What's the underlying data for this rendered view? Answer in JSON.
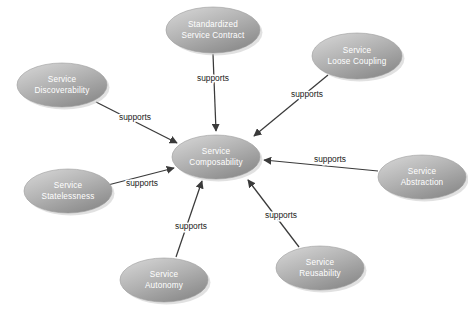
{
  "diagram": {
    "type": "radial-node-link",
    "background_color": "#ffffff",
    "node_fill_light": "#d8d8d8",
    "node_fill_dark": "#8c8c8c",
    "node_text_color": "#ffffff",
    "edge_color": "#3a3a3a",
    "edge_label_color": "#1c1c1c",
    "center": {
      "id": "service-composability",
      "label_line1": "Service",
      "label_line2": "Composability",
      "cx": 216,
      "cy": 157,
      "rx": 44,
      "ry": 22
    },
    "nodes": [
      {
        "id": "standardized-service-contract",
        "label_line1": "Standardized",
        "label_line2": "Service Contract",
        "cx": 213,
        "cy": 30,
        "rx": 47,
        "ry": 23
      },
      {
        "id": "service-loose-coupling",
        "label_line1": "Service",
        "label_line2": "Loose Coupling",
        "cx": 357,
        "cy": 56,
        "rx": 45,
        "ry": 23
      },
      {
        "id": "service-abstraction",
        "label_line1": "Service",
        "label_line2": "Abstraction",
        "cx": 422,
        "cy": 177,
        "rx": 44,
        "ry": 22
      },
      {
        "id": "service-reusability",
        "label_line1": "Service",
        "label_line2": "Reusability",
        "cx": 320,
        "cy": 268,
        "rx": 44,
        "ry": 22
      },
      {
        "id": "service-autonomy",
        "label_line1": "Service",
        "label_line2": "Autonomy",
        "cx": 164,
        "cy": 280,
        "rx": 44,
        "ry": 22
      },
      {
        "id": "service-statelessness",
        "label_line1": "Service",
        "label_line2": "Statelessness",
        "cx": 68,
        "cy": 191,
        "rx": 44,
        "ry": 22
      },
      {
        "id": "service-discoverability",
        "label_line1": "Service",
        "label_line2": "Discoverability",
        "cx": 62,
        "cy": 85,
        "rx": 45,
        "ry": 22
      }
    ],
    "edges": [
      {
        "id": "edge-standardized-service-contract",
        "from": "standardized-service-contract",
        "to": "service-composability",
        "label": "supports",
        "x1": 213,
        "y1": 54,
        "x2": 216,
        "y2": 131,
        "label_x": 213,
        "label_y": 79
      },
      {
        "id": "edge-service-loose-coupling",
        "from": "service-loose-coupling",
        "to": "service-composability",
        "label": "supports",
        "x1": 328,
        "y1": 75,
        "x2": 254,
        "y2": 136,
        "label_x": 307,
        "label_y": 95
      },
      {
        "id": "edge-service-abstraction",
        "from": "service-abstraction",
        "to": "service-composability",
        "label": "supports",
        "x1": 378,
        "y1": 171,
        "x2": 264,
        "y2": 160,
        "label_x": 330,
        "label_y": 160
      },
      {
        "id": "edge-service-reusability",
        "from": "service-reusability",
        "to": "service-composability",
        "label": "supports",
        "x1": 299,
        "y1": 247,
        "x2": 248,
        "y2": 180,
        "label_x": 281,
        "label_y": 216
      },
      {
        "id": "edge-service-autonomy",
        "from": "service-autonomy",
        "to": "service-composability",
        "label": "supports",
        "x1": 176,
        "y1": 257,
        "x2": 202,
        "y2": 181,
        "label_x": 191,
        "label_y": 227
      },
      {
        "id": "edge-service-statelessness",
        "from": "service-statelessness",
        "to": "service-composability",
        "label": "supports",
        "x1": 104,
        "y1": 186,
        "x2": 174,
        "y2": 168,
        "label_x": 142,
        "label_y": 184
      },
      {
        "id": "edge-service-discoverability",
        "from": "service-discoverability",
        "to": "service-composability",
        "label": "supports",
        "x1": 96,
        "y1": 102,
        "x2": 177,
        "y2": 143,
        "label_x": 135,
        "label_y": 118
      }
    ]
  }
}
